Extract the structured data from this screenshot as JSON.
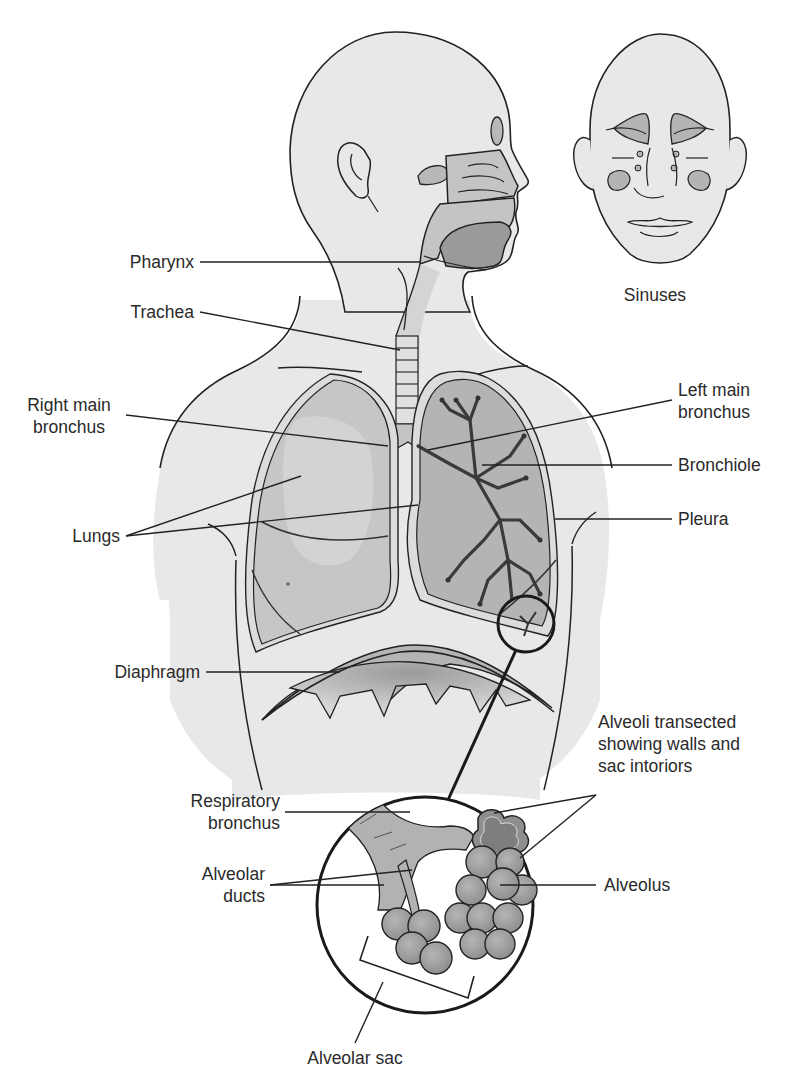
{
  "diagram": {
    "colors": {
      "background": "#ffffff",
      "skin": "#e8e8e8",
      "skin_shadow": "#dcdcdc",
      "tissue_mid": "#c4c4c4",
      "tissue_dark": "#9a9a9a",
      "tissue_darkest": "#7e7e7e",
      "line": "#222222"
    },
    "labels": {
      "pharynx": "Pharynx",
      "trachea": "Trachea",
      "right_main_bronchus": "Right main\nbronchus",
      "lungs": "Lungs",
      "diaphragm": "Diaphragm",
      "sinuses": "Sinuses",
      "left_main_bronchus": "Left main\nbronchus",
      "bronchiole": "Bronchiole",
      "pleura": "Pleura",
      "alveoli_transected": "Alveoli transected\nshowing walls and\nsac intoriors",
      "respiratory_bronchus": "Respiratory\nbronchus",
      "alveolar_ducts": "Alveolar\nducts",
      "alveolus": "Alveolus",
      "alveolar_sac": "Alveolar sac"
    },
    "leader_lines": [
      {
        "name": "pharynx",
        "points": [
          [
            200,
            262
          ],
          [
            420,
            262
          ]
        ]
      },
      {
        "name": "trachea",
        "points": [
          [
            200,
            312
          ],
          [
            400,
            350
          ]
        ]
      },
      {
        "name": "right-main-bronchus",
        "points": [
          [
            126,
            415
          ],
          [
            388,
            446
          ]
        ]
      },
      {
        "name": "lungs-right",
        "points": [
          [
            126,
            536
          ],
          [
            301,
            476
          ]
        ]
      },
      {
        "name": "lungs-left",
        "points": [
          [
            126,
            536
          ],
          [
            418,
            505
          ]
        ]
      },
      {
        "name": "left-main-bronchus",
        "points": [
          [
            672,
            400
          ],
          [
            428,
            450
          ]
        ]
      },
      {
        "name": "bronchiole",
        "points": [
          [
            672,
            465
          ],
          [
            482,
            465
          ]
        ]
      },
      {
        "name": "pleura",
        "points": [
          [
            672,
            519
          ],
          [
            555,
            519
          ]
        ]
      },
      {
        "name": "diaphragm",
        "points": [
          [
            206,
            672
          ],
          [
            340,
            672
          ]
        ]
      },
      {
        "name": "alveoli-transected-1",
        "points": [
          [
            596,
            795
          ],
          [
            494,
            813
          ]
        ]
      },
      {
        "name": "alveoli-transected-2",
        "points": [
          [
            596,
            795
          ],
          [
            520,
            858
          ]
        ]
      },
      {
        "name": "respiratory-bronchus",
        "points": [
          [
            285,
            812
          ],
          [
            410,
            812
          ]
        ]
      },
      {
        "name": "alveolar-ducts-1",
        "points": [
          [
            270,
            885
          ],
          [
            412,
            870
          ]
        ]
      },
      {
        "name": "alveolar-ducts-2",
        "points": [
          [
            270,
            885
          ],
          [
            384,
            885
          ]
        ]
      },
      {
        "name": "alveolus",
        "points": [
          [
            596,
            885
          ],
          [
            500,
            885
          ]
        ]
      },
      {
        "name": "alveolar-sac",
        "points": [
          [
            355,
            1043
          ],
          [
            383,
            982
          ]
        ]
      }
    ]
  }
}
